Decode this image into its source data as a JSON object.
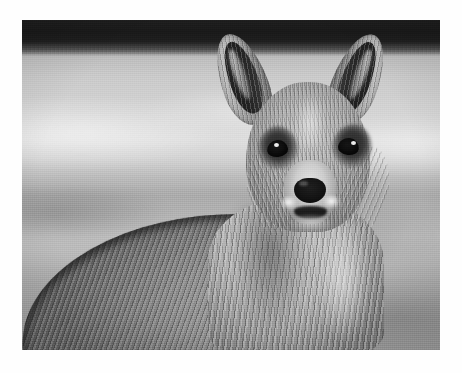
{
  "page": {
    "background_color": "#ffffff",
    "width": 462,
    "height": 373
  },
  "photo": {
    "subject": "kangaroo",
    "alt_text": "Black and white photograph of a kangaroo facing the camera",
    "frame": {
      "left": 22,
      "top": 20,
      "width": 418,
      "height": 330
    },
    "palette": {
      "treeline_dark": "#232322",
      "sky_light": "#dddcd6",
      "field_mid": "#b3b2ab",
      "field_shadow": "#9a9992",
      "fur_light": "#cdcbc4",
      "fur_mid": "#a5a39c",
      "fur_dark": "#63615c",
      "ear_inner": "#232320",
      "eye_black": "#111110",
      "nose_black": "#1a1a18",
      "highlight_white": "#f5f4ee"
    },
    "regions": [
      {
        "name": "treeline-band",
        "label": "Dark treeline band across top"
      },
      {
        "name": "background-field",
        "label": "Blurred grassy field"
      },
      {
        "name": "kangaroo-head",
        "label": "Head facing camera"
      },
      {
        "name": "kangaroo-ear-left",
        "label": "Left ear"
      },
      {
        "name": "kangaroo-ear-right",
        "label": "Right ear"
      },
      {
        "name": "kangaroo-eye-left",
        "label": "Left eye"
      },
      {
        "name": "kangaroo-eye-right",
        "label": "Right eye"
      },
      {
        "name": "kangaroo-muzzle",
        "label": "Muzzle and nose"
      },
      {
        "name": "kangaroo-chest",
        "label": "Chest and neck fur"
      },
      {
        "name": "kangaroo-body",
        "label": "Shoulder and back"
      }
    ]
  }
}
